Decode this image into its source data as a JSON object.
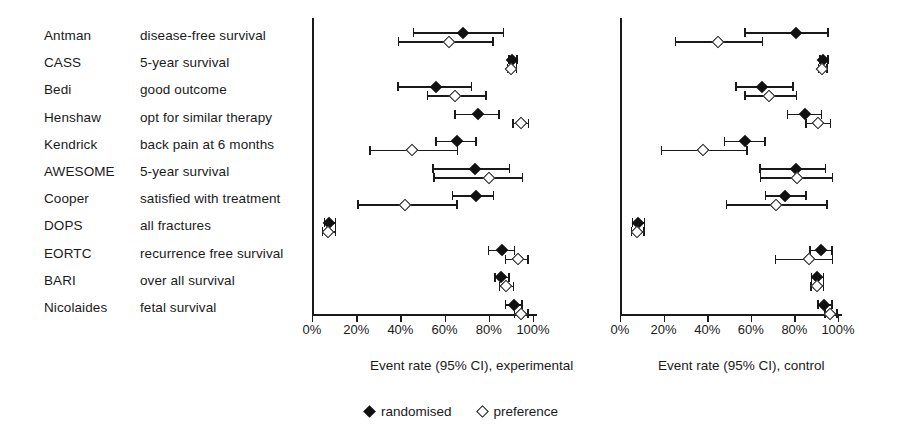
{
  "chart_data": {
    "type": "scatter",
    "title": "",
    "legend": [
      {
        "name": "randomised",
        "marker": "filled-diamond"
      },
      {
        "name": "preference",
        "marker": "open-diamond"
      }
    ],
    "legend_position": "bottom-center",
    "grid": false,
    "panels": [
      {
        "id": "experimental",
        "xlabel": "Event rate (95% CI), experimental",
        "xlim": [
          0,
          100
        ],
        "xticks": [
          0,
          20,
          40,
          60,
          80,
          100
        ],
        "xticklabels": [
          "0%",
          "20%",
          "40%",
          "60%",
          "80%",
          "100%"
        ],
        "rows": [
          {
            "study": "Antman",
            "randomised": {
              "value": 68.5,
              "low": 45.7,
              "high": 86.4
            },
            "preference": {
              "value": 61.9,
              "low": 38.9,
              "high": 81.6
            }
          },
          {
            "study": "CASS",
            "randomised": {
              "value": 90.6,
              "low": 88.7,
              "high": 92.5
            },
            "preference": {
              "value": 90.2,
              "low": 88.2,
              "high": 92.3
            }
          },
          {
            "study": "Bedi",
            "randomised": {
              "value": 56.1,
              "low": 38.5,
              "high": 71.9
            },
            "preference": {
              "value": 64.7,
              "low": 52.0,
              "high": 78.3
            }
          },
          {
            "study": "Henshaw",
            "randomised": {
              "value": 75.0,
              "low": 64.3,
              "high": 84.2
            },
            "preference": {
              "value": 94.6,
              "low": 90.5,
              "high": 97.7
            }
          },
          {
            "study": "Kendrick",
            "randomised": {
              "value": 65.6,
              "low": 55.7,
              "high": 73.8
            },
            "preference": {
              "value": 45.2,
              "low": 25.8,
              "high": 65.6
            }
          },
          {
            "study": "AWESOME",
            "randomised": {
              "value": 73.6,
              "low": 54.3,
              "high": 89.1
            },
            "preference": {
              "value": 80.0,
              "low": 54.8,
              "high": 95.0
            }
          },
          {
            "study": "Cooper",
            "randomised": {
              "value": 74.2,
              "low": 63.3,
              "high": 81.9
            },
            "preference": {
              "value": 42.0,
              "low": 20.4,
              "high": 65.2
            }
          },
          {
            "study": "DOPS",
            "randomised": {
              "value": 7.7,
              "low": 5.4,
              "high": 10.4
            },
            "preference": {
              "value": 7.2,
              "low": 4.5,
              "high": 10.2
            }
          },
          {
            "study": "EORTC",
            "randomised": {
              "value": 86.0,
              "low": 79.6,
              "high": 91.4
            },
            "preference": {
              "value": 93.0,
              "low": 87.3,
              "high": 97.3
            }
          },
          {
            "study": "BARI",
            "randomised": {
              "value": 85.5,
              "low": 82.4,
              "high": 88.7
            },
            "preference": {
              "value": 87.7,
              "low": 84.6,
              "high": 90.9
            }
          },
          {
            "study": "Nicolaides",
            "randomised": {
              "value": 91.4,
              "low": 87.3,
              "high": 94.6
            },
            "preference": {
              "value": 94.6,
              "low": 91.4,
              "high": 97.3
            }
          }
        ]
      },
      {
        "id": "control",
        "xlabel": "Event rate (95% CI), control",
        "xlim": [
          0,
          100
        ],
        "xticks": [
          0,
          20,
          40,
          60,
          80,
          100
        ],
        "xticklabels": [
          "0%",
          "20%",
          "40%",
          "60%",
          "80%",
          "100%"
        ],
        "rows": [
          {
            "study": "Antman",
            "randomised": {
              "value": 80.7,
              "low": 56.9,
              "high": 95.0
            },
            "preference": {
              "value": 44.8,
              "low": 25.2,
              "high": 65.1
            }
          },
          {
            "study": "CASS",
            "randomised": {
              "value": 93.1,
              "low": 91.3,
              "high": 95.0
            },
            "preference": {
              "value": 92.7,
              "low": 90.8,
              "high": 94.5
            }
          },
          {
            "study": "Bedi",
            "randomised": {
              "value": 65.1,
              "low": 52.8,
              "high": 78.9
            },
            "preference": {
              "value": 68.3,
              "low": 56.9,
              "high": 80.7
            }
          },
          {
            "study": "Henshaw",
            "randomised": {
              "value": 84.9,
              "low": 76.6,
              "high": 92.2
            },
            "preference": {
              "value": 90.8,
              "low": 84.9,
              "high": 96.3
            }
          },
          {
            "study": "Kendrick",
            "randomised": {
              "value": 57.3,
              "low": 47.7,
              "high": 66.1
            },
            "preference": {
              "value": 38.1,
              "low": 18.8,
              "high": 57.8
            }
          },
          {
            "study": "AWESOME",
            "randomised": {
              "value": 80.7,
              "low": 63.8,
              "high": 94.0
            },
            "preference": {
              "value": 81.2,
              "low": 64.2,
              "high": 97.2
            }
          },
          {
            "study": "Cooper",
            "randomised": {
              "value": 75.7,
              "low": 66.5,
              "high": 84.9
            },
            "preference": {
              "value": 71.6,
              "low": 48.6,
              "high": 94.5
            }
          },
          {
            "study": "DOPS",
            "randomised": {
              "value": 8.3,
              "low": 5.5,
              "high": 11.0
            },
            "preference": {
              "value": 7.8,
              "low": 5.0,
              "high": 10.6
            }
          },
          {
            "study": "EORTC",
            "randomised": {
              "value": 92.2,
              "low": 86.7,
              "high": 96.8
            },
            "preference": {
              "value": 86.7,
              "low": 71.1,
              "high": 97.2
            }
          },
          {
            "study": "BARI",
            "randomised": {
              "value": 90.4,
              "low": 87.6,
              "high": 93.1
            },
            "preference": {
              "value": 90.4,
              "low": 87.2,
              "high": 93.1
            }
          },
          {
            "study": "Nicolaides",
            "randomised": {
              "value": 93.6,
              "low": 90.4,
              "high": 96.8
            },
            "preference": {
              "value": 96.3,
              "low": 93.6,
              "high": 99.1
            }
          }
        ]
      }
    ]
  },
  "study_labels": [
    {
      "study": "Antman",
      "outcome": "disease-free survival"
    },
    {
      "study": "CASS",
      "outcome": "5-year survival"
    },
    {
      "study": "Bedi",
      "outcome": "good outcome"
    },
    {
      "study": "Henshaw",
      "outcome": "opt for similar therapy"
    },
    {
      "study": "Kendrick",
      "outcome": "back pain at 6 months"
    },
    {
      "study": "AWESOME",
      "outcome": "5-year survival"
    },
    {
      "study": "Cooper",
      "outcome": "satisfied with treatment"
    },
    {
      "study": "DOPS",
      "outcome": "all fractures"
    },
    {
      "study": "EORTC",
      "outcome": "recurrence free survival"
    },
    {
      "study": "BARI",
      "outcome": "over all survival"
    },
    {
      "study": "Nicolaides",
      "outcome": "fetal survival"
    }
  ],
  "colors": {
    "ink": "#1a1a1a",
    "marker_fill": "#111111",
    "background": "#ffffff"
  }
}
